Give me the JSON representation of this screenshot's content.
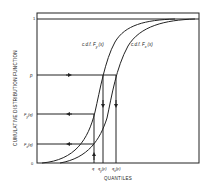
{
  "diagram": {
    "ylabel": "CUMULATIVE DISTRIBUTION FUNCTION",
    "xlabel": "QUANTILES",
    "curves": [
      {
        "name": "c.d.f. F_y(x)",
        "label_main": "c.d.f. F",
        "label_sub": "y",
        "label_tail": "(x)"
      },
      {
        "name": "c.d.f. F_x(x)",
        "label_main": "c.d.f. F",
        "label_sub": "x",
        "label_tail": "(x)"
      }
    ],
    "y_ticks": [
      {
        "label": "1"
      },
      {
        "label": "p"
      },
      {
        "label_main": "F",
        "label_sub": "y",
        "label_tail": "(q)"
      },
      {
        "label_main": "F",
        "label_sub": "x",
        "label_tail": "(q)"
      },
      {
        "label": "0"
      }
    ],
    "x_ticks": [
      {
        "label": "q"
      },
      {
        "label_main": "q",
        "label_sub": "y",
        "label_tail": "(p)"
      },
      {
        "label_main": "q",
        "label_sub": "x",
        "label_tail": "(p)"
      }
    ],
    "colors": {
      "ink": "#222222",
      "paper": "#ffffff"
    }
  }
}
